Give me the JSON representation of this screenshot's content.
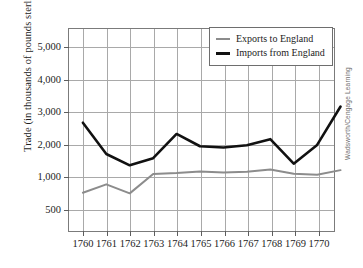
{
  "chart_data": {
    "type": "line",
    "title": "",
    "xlabel": "",
    "ylabel": "Trade (in thousands of pounds sterling)",
    "categories": [
      "1760",
      "1761",
      "1762",
      "1763",
      "1764",
      "1765",
      "1766",
      "1767",
      "1768",
      "1769",
      "1770",
      ""
    ],
    "x_tick_labels": [
      "1760",
      "1761",
      "1762",
      "1763",
      "1764",
      "1765",
      "1766",
      "1767",
      "1768",
      "1769",
      "1770"
    ],
    "y_tick_labels": [
      "5,000",
      "4,000",
      "3,000",
      "2,000",
      "1,000",
      "500"
    ],
    "y_tick_values": [
      5000,
      4000,
      3000,
      2000,
      1000,
      500
    ],
    "ylim": [
      0,
      5750
    ],
    "grid": true,
    "legend_position": "top-right",
    "series": [
      {
        "name": "Exports to England",
        "color": "#8c8c8c",
        "width": 2.0,
        "values": [
          740,
          870,
          730,
          1060,
          1090,
          1140,
          1110,
          1130,
          1200,
          1070,
          1040,
          1180
        ]
      },
      {
        "name": "Imports from England",
        "color": "#111111",
        "width": 2.6,
        "values": [
          2650,
          1680,
          1330,
          1550,
          2300,
          1920,
          1880,
          1950,
          2140,
          1380,
          1960,
          3150
        ]
      }
    ]
  },
  "legend": {
    "items": [
      {
        "label": "Exports to England"
      },
      {
        "label": "Imports from England"
      }
    ]
  },
  "credit": {
    "text": "Wadsworth/Cengage Learning"
  },
  "colors": {
    "exports": "#8c8c8c",
    "imports": "#111111",
    "grid": "#a9a9a9",
    "frame": "#7b7b7b",
    "text": "#1d1d1d",
    "background": "#ffffff"
  }
}
